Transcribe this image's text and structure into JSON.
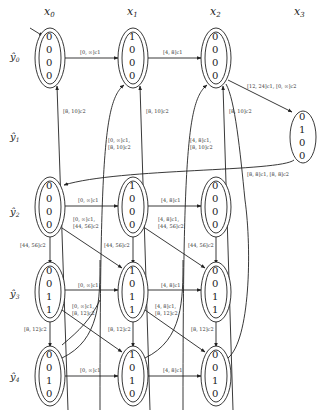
{
  "columns": [
    {
      "label": "x0",
      "sub": "0",
      "x": 78
    },
    {
      "label": "x1",
      "sub": "1",
      "x": 161
    },
    {
      "label": "x2",
      "sub": "2",
      "x": 244
    },
    {
      "label": "x3",
      "sub": "3",
      "x": 303
    }
  ],
  "rows": [
    {
      "label": "ŷ0",
      "sub": "0",
      "y": 55
    },
    {
      "label": "ŷ1",
      "sub": "1",
      "y": 135
    },
    {
      "label": "ŷ2",
      "sub": "2",
      "y": 210
    },
    {
      "label": "ŷ3",
      "sub": "3",
      "y": 292
    },
    {
      "label": "ŷ4",
      "sub": "4",
      "y": 375
    }
  ],
  "nodes": [
    {
      "id": "n00",
      "cx": 50,
      "cy": 55,
      "bits": [
        "0",
        "0",
        "0",
        "0"
      ],
      "accepting": true,
      "initial": true
    },
    {
      "id": "n01",
      "cx": 133,
      "cy": 55,
      "bits": [
        "1",
        "0",
        "0",
        "0"
      ],
      "accepting": true
    },
    {
      "id": "n02",
      "cx": 216,
      "cy": 55,
      "bits": [
        "0",
        "0",
        "0",
        "0"
      ],
      "accepting": true
    },
    {
      "id": "n13",
      "cx": 303,
      "cy": 135,
      "bits": [
        "0",
        "1",
        "0",
        "0"
      ],
      "accepting": false
    },
    {
      "id": "n20",
      "cx": 50,
      "cy": 210,
      "bits": [
        "0",
        "0",
        "0",
        "0"
      ],
      "accepting": true
    },
    {
      "id": "n21",
      "cx": 133,
      "cy": 210,
      "bits": [
        "1",
        "0",
        "0",
        "0"
      ],
      "accepting": true
    },
    {
      "id": "n22",
      "cx": 216,
      "cy": 210,
      "bits": [
        "0",
        "0",
        "0",
        "0"
      ],
      "accepting": true
    },
    {
      "id": "n30",
      "cx": 50,
      "cy": 292,
      "bits": [
        "0",
        "0",
        "1",
        "1"
      ],
      "accepting": true
    },
    {
      "id": "n31",
      "cx": 133,
      "cy": 292,
      "bits": [
        "1",
        "0",
        "1",
        "1"
      ],
      "accepting": true
    },
    {
      "id": "n32",
      "cx": 216,
      "cy": 292,
      "bits": [
        "0",
        "0",
        "1",
        "1"
      ],
      "accepting": true
    },
    {
      "id": "n40",
      "cx": 50,
      "cy": 375,
      "bits": [
        "0",
        "0",
        "1",
        "0"
      ],
      "accepting": true
    },
    {
      "id": "n41",
      "cx": 133,
      "cy": 375,
      "bits": [
        "1",
        "0",
        "1",
        "0"
      ],
      "accepting": true
    },
    {
      "id": "n42",
      "cx": 216,
      "cy": 375,
      "bits": [
        "0",
        "0",
        "1",
        "0"
      ],
      "accepting": true
    }
  ],
  "edge_labels": {
    "e00_01": "[0, ∞]c1",
    "e01_02": "[4, 8]c1",
    "e02_13": "[12, 24]c1, [0, ∞]c2",
    "e13_20": "[8, 8]c1, [8, 8]c2",
    "e20_00": "[8, 10]c2",
    "e21_01": "[8, 10]c2",
    "e20_01": "[0, ∞]c1,",
    "e20_01b": "[8, 10]c2",
    "e21_02a": "[4, 8]c1,",
    "e21_02b": "[8, 10]c2",
    "e22_02": "[8, 10]c2",
    "e20_21": "[0, ∞]c1",
    "e21_22": "[4, 8]c1",
    "e20_31a": "[0, ∞]c1,",
    "e20_31b": "[44, 56]c2",
    "e21_32a": "[4, 8]c1,",
    "e21_32b": "[44, 56]c2",
    "e20_30": "[44, 56]c2",
    "e21_31": "[44, 56]c2",
    "e22_32": "[44, 56]c2",
    "e30_31": "[0, ∞]c1",
    "e31_32": "[4, 8]c1",
    "e30_41a": "[0, ∞]c1,",
    "e30_41b": "[8, 12]c2",
    "e31_42a": "[4, 8]c1,",
    "e31_42b": "[8, 12]c2",
    "e30_40": "[8, 12]c2",
    "e31_41": "[8, 12]c2",
    "e32_42": "[8, 12]c2",
    "e40_41": "[0, ∞]c1",
    "e41_42": "[4, 8]c1"
  }
}
